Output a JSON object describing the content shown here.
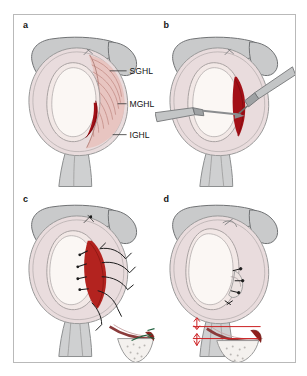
{
  "figure": {
    "panels": [
      {
        "id": "a",
        "letter": "a",
        "caption": "Normal glenohumeral ligament anatomy with detached anterior labrum",
        "labels": [
          {
            "text": "SGHL",
            "name": "superior-glenohumeral-ligament"
          },
          {
            "text": "MGHL",
            "name": "middle-glenohumeral-ligament"
          },
          {
            "text": "IGHL",
            "name": "inferior-glenohumeral-ligament"
          }
        ]
      },
      {
        "id": "b",
        "letter": "b",
        "caption": "Arthroscopic instruments mobilising the detached labrum"
      },
      {
        "id": "c",
        "letter": "c",
        "caption": "Sutures passed through the labrum and capsule"
      },
      {
        "id": "d",
        "letter": "d",
        "caption": "Completed repair with restored labral bumper"
      }
    ],
    "colors": {
      "bone": "#c9cacb",
      "bone_outline": "#6f7173",
      "capsule": "#e9dcdd",
      "capsule_outline": "#9a9a9a",
      "glenoid_face": "#fbf7f4",
      "ligament_pink": "#e8c3bf",
      "lesion_red": "#a31017",
      "suture_dark": "#1b1b1b",
      "arrow_red": "#cc1f22",
      "frame": "#b9b9b9",
      "label_text": "#111111"
    }
  }
}
